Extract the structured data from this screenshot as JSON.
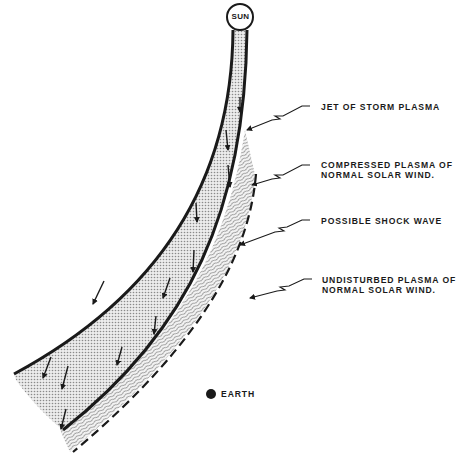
{
  "diagram": {
    "colors": {
      "ink": "#1a1a1a",
      "background": "#ffffff",
      "jet_fill": "#d4d4d4",
      "compressed_fill": "#e6e6e6"
    },
    "sun": {
      "label": "SUN"
    },
    "earth": {
      "label": "EARTH"
    },
    "labels": [
      {
        "id": "jet",
        "lines": [
          "JET OF STORM PLASMA"
        ]
      },
      {
        "id": "compressed",
        "lines": [
          "COMPRESSED PLASMA OF",
          "NORMAL SOLAR WIND."
        ]
      },
      {
        "id": "shock",
        "lines": [
          "POSSIBLE SHOCK WAVE"
        ]
      },
      {
        "id": "undisturbed",
        "lines": [
          "UNDISTURBED PLASMA OF",
          "NORMAL SOLAR WIND."
        ]
      }
    ]
  }
}
